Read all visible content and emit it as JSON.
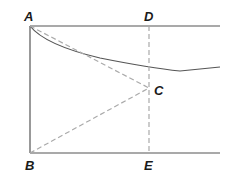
{
  "diagram": {
    "points": {
      "A": {
        "label": "A",
        "x": 30,
        "y": 26
      },
      "B": {
        "label": "B",
        "x": 30,
        "y": 153
      },
      "C": {
        "label": "C",
        "x": 149,
        "y": 88
      },
      "D": {
        "label": "D",
        "x": 149,
        "y": 26
      },
      "E": {
        "label": "E",
        "x": 149,
        "y": 153
      }
    },
    "colors": {
      "solid_line": "#555555",
      "dashed_line": "#aaaaaa",
      "label": "#1a1a1a"
    }
  }
}
